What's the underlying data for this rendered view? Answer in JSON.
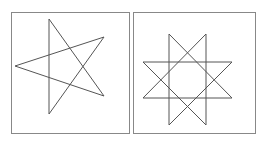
{
  "figure": {
    "panels": [
      {
        "name": "five-pointed-star",
        "frame": {
          "x": 11,
          "y": 12,
          "w": 118,
          "h": 121
        },
        "points": "49,19 104,96 15,66 104,37 49,114 49,19"
      },
      {
        "name": "eight-pointed-star",
        "frame": {
          "x": 133,
          "y": 12,
          "w": 122,
          "h": 121
        },
        "square_a": "169,34 232,98 143,98 206,34 206,125 143,62 232,62 169,125 169,34"
      }
    ],
    "colors": {
      "frame": "#888888",
      "stroke": "#555555",
      "background": "#ffffff"
    }
  }
}
